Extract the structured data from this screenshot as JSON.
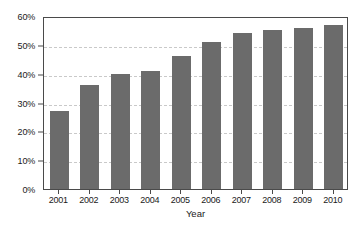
{
  "chart_data": {
    "type": "bar",
    "title": "",
    "subtitle": "",
    "xlabel": "Year",
    "ylabel": "",
    "categories": [
      "2001",
      "2002",
      "2003",
      "2004",
      "2005",
      "2006",
      "2007",
      "2008",
      "2009",
      "2010"
    ],
    "values": [
      27,
      36,
      40,
      41,
      46,
      51,
      54,
      55,
      56,
      57
    ],
    "ylim": [
      0,
      60
    ],
    "ytick_values": [
      0,
      10,
      20,
      30,
      40,
      50,
      60
    ],
    "ytick_labels": [
      "0%",
      "10%",
      "20%",
      "30%",
      "40%",
      "50%",
      "60%"
    ],
    "grid": "horizontal-dashed",
    "legend": "none",
    "series": [
      {
        "name": "",
        "values": [
          27,
          36,
          40,
          41,
          46,
          51,
          54,
          55,
          56,
          57
        ]
      }
    ],
    "colors": {
      "bar": "#6b6b6b",
      "gridline": "#c9c9c9",
      "axis": "#4a4a4a",
      "text": "#1a1a1a",
      "background": "#ffffff"
    }
  }
}
